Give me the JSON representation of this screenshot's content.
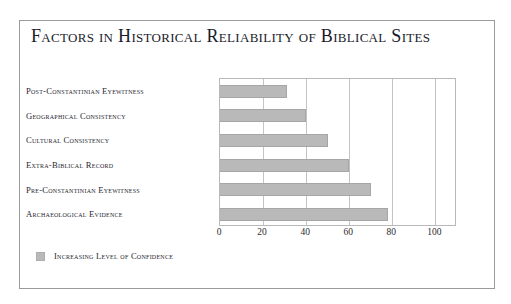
{
  "chart_data": {
    "type": "bar",
    "orientation": "horizontal",
    "title": "Factors in Historical Reliability of Biblical Sites",
    "xlabel": "",
    "ylabel": "",
    "xlim": [
      0,
      110
    ],
    "xticks": [
      0,
      20,
      40,
      60,
      80,
      100
    ],
    "grid": true,
    "legend_position": "bottom-left",
    "bar_color": "#b9b9b9",
    "bar_border_color": "#a6a6a6",
    "frame_color": "#9a9a9a",
    "gridline_color": "#c4c4c4",
    "title_color": "#1b1b2a",
    "text_color": "#26262e",
    "categories": [
      "Post-Constantinian Eyewitness",
      "Geographical Consistency",
      "Cultural Consistency",
      "Extra-Biblical Record",
      "Pre-Constantinian Eyewitness",
      "Archaeological Evidence"
    ],
    "values": [
      31,
      40,
      50,
      60,
      70,
      78
    ],
    "series": [
      {
        "name": "Increasing Level of Confidence",
        "values": [
          31,
          40,
          50,
          60,
          70,
          78
        ]
      }
    ],
    "legend": [
      {
        "label": "Increasing Level of Confidence",
        "color": "#b9b9b9"
      }
    ]
  }
}
